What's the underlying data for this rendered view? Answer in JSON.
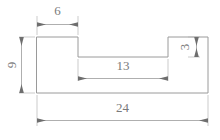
{
  "drawing": {
    "type": "engineering-dimension-drawing",
    "title": "",
    "units": "",
    "canvas": {
      "width": 220,
      "height": 140
    },
    "profile": {
      "name": "stepped-z-profile",
      "description": "Closed polyline outline with a raised left tab and a raised right tab separated by a recessed middle section.",
      "overall_width": 24,
      "overall_height": 9,
      "left_tab_width": 6,
      "recess_width": 13,
      "right_tab_height": 3
    },
    "dimensions": [
      {
        "id": "dim-6",
        "label": "6",
        "value": 6,
        "orientation": "horizontal",
        "position": "top",
        "measures": "left-tab-width"
      },
      {
        "id": "dim-9",
        "label": "9",
        "value": 9,
        "orientation": "vertical",
        "position": "left",
        "measures": "overall-height"
      },
      {
        "id": "dim-3",
        "label": "3",
        "value": 3,
        "orientation": "vertical",
        "position": "right-inner",
        "measures": "right-tab-height"
      },
      {
        "id": "dim-13",
        "label": "13",
        "value": 13,
        "orientation": "horizontal",
        "position": "middle",
        "measures": "recess-width"
      },
      {
        "id": "dim-24",
        "label": "24",
        "value": 24,
        "orientation": "horizontal",
        "position": "bottom",
        "measures": "overall-width"
      }
    ],
    "colors": {
      "outline": "#9a9a9a",
      "dimension_line": "#9a9a9a",
      "extension_line": "#b4b4b4",
      "arrow": "#6e6e6e",
      "text": "#7a7a7a",
      "background": "#ffffff"
    }
  }
}
